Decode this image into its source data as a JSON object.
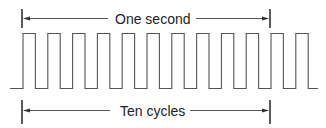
{
  "diagram": {
    "type": "square-wave-timing",
    "top_label": "One second",
    "bottom_label": "Ten cycles",
    "pulse_count": 12,
    "duty_cycle": 0.5,
    "colors": {
      "stroke": "#555555",
      "text": "#222222",
      "background": "#ffffff"
    }
  }
}
